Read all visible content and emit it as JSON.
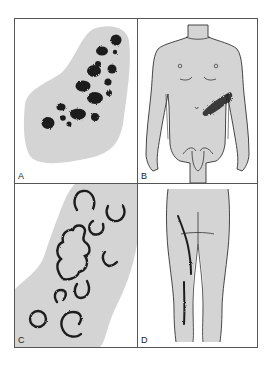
{
  "figure": {
    "panels": [
      {
        "id": "A",
        "label": "A",
        "description": "Clustered dark macular lesions on gray skin patch"
      },
      {
        "id": "B",
        "label": "B",
        "description": "Male torso front view with lesion band on left flank"
      },
      {
        "id": "C",
        "label": "C",
        "description": "Annular ring-shaped lesions on gray skin patch"
      },
      {
        "id": "D",
        "label": "D",
        "description": "Posterior legs view with linear lesions along thigh and calf"
      }
    ],
    "colors": {
      "skin": "#d4d4d4",
      "lesion": "#1e1e1e",
      "outline": "#333333",
      "border": "#555555",
      "background": "#ffffff"
    }
  }
}
